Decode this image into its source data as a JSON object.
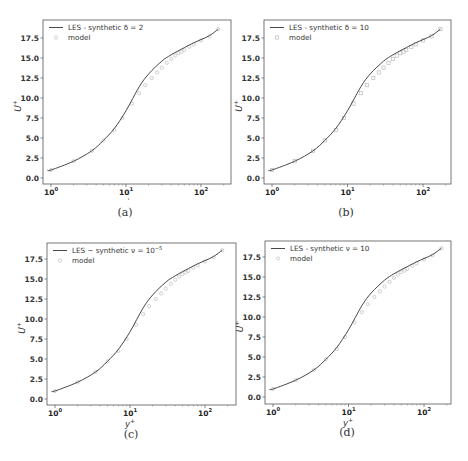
{
  "figure": {
    "captions": [
      "(a)",
      "(b)",
      "(c)",
      "(d)"
    ]
  },
  "chart_data": [
    {
      "type": "line",
      "panel": "a",
      "title": "",
      "xlabel": "y+",
      "ylabel": "U+",
      "xscale": "log",
      "xlim": [
        0.9,
        200
      ],
      "ylim": [
        -0.8,
        19.3
      ],
      "xticks": [
        1,
        10,
        100
      ],
      "xtick_labels": [
        "10^0",
        "10^1",
        "10^2"
      ],
      "yticks": [
        0.0,
        2.5,
        5.0,
        7.5,
        10.0,
        12.5,
        15.0,
        17.5
      ],
      "ytick_labels": [
        "0.0",
        "2.5",
        "5.0",
        "7.5",
        "10.0",
        "12.5",
        "15.0",
        "17.5"
      ],
      "legend_position": "upper left",
      "series": [
        {
          "name": "LES - synthetic δ = 2",
          "style": "line",
          "color": "#333333",
          "x": [
            0.9,
            1,
            2,
            3.5,
            5,
            7,
            10,
            15,
            20,
            30,
            40,
            60,
            80,
            100,
            130,
            170
          ],
          "y": [
            1.0,
            1.0,
            2.1,
            3.4,
            4.7,
            6.2,
            8.4,
            11.4,
            13.0,
            14.6,
            15.4,
            16.3,
            16.9,
            17.3,
            17.8,
            18.6
          ]
        },
        {
          "name": "model",
          "style": "marker-circle",
          "color": "#bbbbbb",
          "x": [
            1,
            2,
            3.5,
            5,
            7,
            9,
            12,
            15,
            18,
            22,
            26,
            30,
            35,
            40,
            45,
            50,
            55,
            60,
            70,
            80,
            100,
            130,
            170
          ],
          "y": [
            1.0,
            2.1,
            3.4,
            4.7,
            6.0,
            7.5,
            9.3,
            10.6,
            11.6,
            12.5,
            13.2,
            13.8,
            14.4,
            14.9,
            15.3,
            15.6,
            15.8,
            16.0,
            16.4,
            16.7,
            17.2,
            17.7,
            18.6
          ]
        }
      ]
    },
    {
      "type": "line",
      "panel": "b",
      "title": "",
      "xlabel": "y+",
      "ylabel": "U+",
      "xscale": "log",
      "xlim": [
        0.9,
        200
      ],
      "ylim": [
        -0.8,
        19.3
      ],
      "xticks": [
        1,
        10,
        100
      ],
      "xtick_labels": [
        "10^0",
        "10^1",
        "10^2"
      ],
      "yticks": [
        0.0,
        2.5,
        5.0,
        7.5,
        10.0,
        12.5,
        15.0,
        17.5
      ],
      "ytick_labels": [
        "0.0",
        "2.5",
        "5.0",
        "7.5",
        "10.0",
        "12.5",
        "15.0",
        "17.5"
      ],
      "legend_position": "upper left",
      "series": [
        {
          "name": "LES - synthetic δ = 10",
          "style": "line",
          "color": "#333333",
          "x": [
            0.9,
            1,
            2,
            3.5,
            5,
            7,
            10,
            15,
            20,
            30,
            40,
            60,
            80,
            100,
            130,
            170
          ],
          "y": [
            1.0,
            1.0,
            2.1,
            3.4,
            4.7,
            6.2,
            8.4,
            11.4,
            13.0,
            14.6,
            15.4,
            16.3,
            16.9,
            17.3,
            17.8,
            18.6
          ]
        },
        {
          "name": "model",
          "style": "marker-square",
          "color": "#bbbbbb",
          "x": [
            1,
            2,
            3.5,
            5,
            7,
            9,
            12,
            15,
            18,
            22,
            26,
            30,
            35,
            40,
            45,
            50,
            55,
            60,
            70,
            80,
            100,
            130,
            170
          ],
          "y": [
            1.0,
            2.1,
            3.4,
            4.7,
            6.0,
            7.5,
            9.3,
            10.6,
            11.6,
            12.5,
            13.2,
            13.8,
            14.4,
            14.9,
            15.3,
            15.6,
            15.8,
            16.0,
            16.4,
            16.7,
            17.2,
            17.7,
            18.6
          ]
        }
      ]
    },
    {
      "type": "line",
      "panel": "c",
      "title": "",
      "xlabel": "y+",
      "ylabel": "U+",
      "xscale": "log",
      "xlim": [
        0.9,
        200
      ],
      "ylim": [
        -0.8,
        19.3
      ],
      "xticks": [
        1,
        10,
        100
      ],
      "xtick_labels": [
        "10^0",
        "10^1",
        "10^2"
      ],
      "yticks": [
        0.0,
        2.5,
        5.0,
        7.5,
        10.0,
        12.5,
        15.0,
        17.5
      ],
      "ytick_labels": [
        "0.0",
        "2.5",
        "5.0",
        "7.5",
        "10.0",
        "12.5",
        "15.0",
        "17.5"
      ],
      "legend_position": "upper left",
      "series": [
        {
          "name": "LES - synthetic ν = 10^-5",
          "style": "line",
          "color": "#333333",
          "x": [
            0.9,
            1,
            2,
            3.5,
            5,
            7,
            10,
            15,
            20,
            30,
            40,
            60,
            80,
            100,
            130,
            170
          ],
          "y": [
            1.0,
            1.0,
            2.1,
            3.4,
            4.7,
            6.2,
            8.4,
            11.4,
            13.0,
            14.6,
            15.4,
            16.3,
            16.9,
            17.3,
            17.8,
            18.6
          ]
        },
        {
          "name": "model",
          "style": "marker-circle",
          "color": "#bbbbbb",
          "x": [
            1,
            2,
            3.5,
            5,
            7,
            9,
            12,
            15,
            18,
            22,
            26,
            30,
            35,
            40,
            45,
            50,
            55,
            60,
            70,
            80,
            100,
            130,
            170
          ],
          "y": [
            1.0,
            2.1,
            3.4,
            4.7,
            6.0,
            7.5,
            9.3,
            10.6,
            11.6,
            12.5,
            13.2,
            13.8,
            14.4,
            14.9,
            15.3,
            15.6,
            15.8,
            16.0,
            16.4,
            16.7,
            17.2,
            17.7,
            18.6
          ]
        }
      ]
    },
    {
      "type": "line",
      "panel": "d",
      "title": "",
      "xlabel": "y+",
      "ylabel": "U+",
      "xscale": "log",
      "xlim": [
        0.9,
        200
      ],
      "ylim": [
        -0.8,
        19.3
      ],
      "xticks": [
        1,
        10,
        100
      ],
      "xtick_labels": [
        "10^0",
        "10^1",
        "10^2"
      ],
      "yticks": [
        0.0,
        2.5,
        5.0,
        7.5,
        10.0,
        12.5,
        15.0,
        17.5
      ],
      "ytick_labels": [
        "0.0",
        "2.5",
        "5.0",
        "7.5",
        "10.0",
        "12.5",
        "15.0",
        "17.5"
      ],
      "legend_position": "upper left",
      "series": [
        {
          "name": "LES - synthetic ν = 10",
          "style": "line",
          "color": "#333333",
          "x": [
            0.9,
            1,
            2,
            3.5,
            5,
            7,
            10,
            15,
            20,
            30,
            40,
            60,
            80,
            100,
            130,
            170
          ],
          "y": [
            1.0,
            1.0,
            2.1,
            3.4,
            4.7,
            6.2,
            8.4,
            11.4,
            13.0,
            14.6,
            15.4,
            16.3,
            16.9,
            17.3,
            17.8,
            18.6
          ]
        },
        {
          "name": "model",
          "style": "marker-circle",
          "color": "#bbbbbb",
          "x": [
            1,
            2,
            3.5,
            5,
            7,
            9,
            12,
            15,
            18,
            22,
            26,
            30,
            35,
            40,
            45,
            50,
            55,
            60,
            70,
            80,
            100,
            130,
            170
          ],
          "y": [
            1.0,
            2.1,
            3.4,
            4.7,
            6.0,
            7.5,
            9.3,
            10.6,
            11.6,
            12.5,
            13.2,
            13.8,
            14.4,
            14.9,
            15.3,
            15.6,
            15.8,
            16.0,
            16.4,
            16.7,
            17.2,
            17.7,
            18.6
          ]
        }
      ]
    }
  ]
}
